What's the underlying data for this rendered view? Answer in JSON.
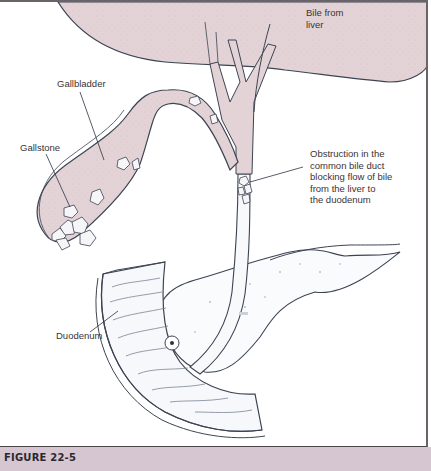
{
  "figure": {
    "caption": "FIGURE 22-5",
    "labels": {
      "bile_from_liver": "Bile from\nliver",
      "gallbladder": "Gallbladder",
      "gallstone": "Gallstone",
      "obstruction": "Obstruction in the\ncommon bile duct\nblocking flow of bile\nfrom the liver to\nthe duodenum",
      "duodenum": "Duodenum"
    },
    "structures": [
      "liver",
      "hepatic ducts",
      "gallbladder",
      "cystic duct",
      "gallstones",
      "common bile duct",
      "pancreas",
      "duodenum",
      "ampulla"
    ],
    "colors": {
      "tissue_fill": "#e3d2d6",
      "caption_bar": "#d6c6d2",
      "outline": "#3c4452",
      "frame": "#6a6468"
    }
  }
}
